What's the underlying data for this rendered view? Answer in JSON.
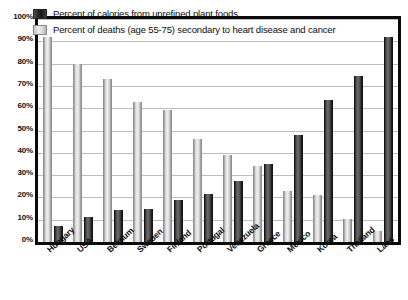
{
  "chart_data": {
    "type": "bar",
    "title": "",
    "xlabel": "",
    "ylabel": "",
    "ylim": [
      0,
      100
    ],
    "grid": true,
    "legend_position": "inside-top-left",
    "categories": [
      "Hungary",
      "USA",
      "Belgium",
      "Sweden",
      "Finland",
      "Portugal",
      "Venezuela",
      "Greece",
      "Mexico",
      "Korea",
      "Thailand",
      "Laos"
    ],
    "ytick_labels": [
      "0%",
      "10%",
      "20%",
      "30%",
      "40%",
      "50%",
      "60%",
      "70%",
      "80%",
      "90%",
      "100%"
    ],
    "ytick_values": [
      0,
      10,
      20,
      30,
      40,
      50,
      60,
      70,
      80,
      90,
      100
    ],
    "series": [
      {
        "name": "Percent of calories from unrefined plant foods",
        "color": "#2b2b2b",
        "values": [
          7,
          11,
          14.5,
          15,
          19,
          21.5,
          27.5,
          35,
          48,
          63.5,
          74.5,
          92
        ]
      },
      {
        "name": "Percent of deaths (age 55-75) secondary to heart disease and cancer",
        "color": "#d8d8d8",
        "values": [
          92,
          80,
          73,
          63,
          59,
          46,
          39,
          34,
          23,
          21,
          10.5,
          5
        ]
      }
    ]
  },
  "legend": {
    "items": [
      {
        "label": "Percent of calories from unrefined plant foods",
        "swatch": "dark"
      },
      {
        "label": "Percent of deaths (age 55-75) secondary to heart disease and cancer",
        "swatch": "light"
      }
    ]
  },
  "colors": {
    "bar_dark": "#2b2b2b",
    "bar_light": "#d8d8d8",
    "frame": "#0a0a0a",
    "gridline": "#bdbdbd",
    "background": "#ffffff",
    "text": "#0d0d0d"
  }
}
